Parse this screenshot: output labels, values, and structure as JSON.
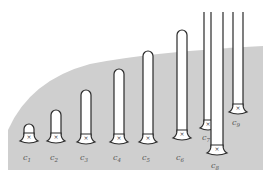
{
  "colors": {
    "background": "#ffffff",
    "region": "#cfcfcf",
    "tube_stroke": "#2a2a2a",
    "tube_fill": "#ffffff",
    "label": "#555555"
  },
  "region": {
    "path": "M 8 170 L 263 170 L 263 46 Q 150 52 90 64 Q 30 80 8 130 Z"
  },
  "tubes": [
    {
      "id": "c1",
      "label": "c",
      "sub": "1",
      "x": 29,
      "top": 124,
      "base": 141,
      "w": 10,
      "label_y": 160
    },
    {
      "id": "c2",
      "label": "c",
      "sub": "2",
      "x": 56,
      "top": 110,
      "base": 141,
      "w": 10,
      "label_y": 160
    },
    {
      "id": "c3",
      "label": "c",
      "sub": "3",
      "x": 86,
      "top": 90,
      "base": 142,
      "w": 10,
      "label_y": 160
    },
    {
      "id": "c4",
      "label": "c",
      "sub": "4",
      "x": 119,
      "top": 69,
      "base": 142,
      "w": 10,
      "label_y": 160
    },
    {
      "id": "c5",
      "label": "c",
      "sub": "5",
      "x": 148,
      "top": 51,
      "base": 142,
      "w": 10,
      "label_y": 160
    },
    {
      "id": "c6",
      "label": "c",
      "sub": "6",
      "x": 182,
      "top": 30,
      "base": 138,
      "w": 10,
      "label_y": 160
    },
    {
      "id": "c7",
      "label": "c",
      "sub": "7",
      "x": 208,
      "top": 12,
      "base": 128,
      "w": 8,
      "open": true,
      "label_y": 140
    },
    {
      "id": "c8",
      "label": "c",
      "sub": "8",
      "x": 217,
      "top": 12,
      "base": 153,
      "w": 12,
      "open": true,
      "label_y": 168
    },
    {
      "id": "c9",
      "label": "c",
      "sub": "9",
      "x": 238,
      "top": 12,
      "base": 112,
      "w": 10,
      "open": true,
      "label_y": 125
    }
  ]
}
